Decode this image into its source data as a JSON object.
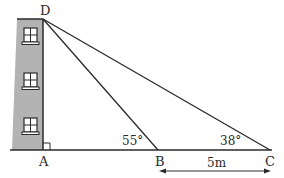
{
  "diagram": {
    "type": "trigonometry-angle-of-elevation",
    "points": {
      "D": {
        "label": "D"
      },
      "A": {
        "label": "A"
      },
      "B": {
        "label": "B"
      },
      "C": {
        "label": "C"
      }
    },
    "angles": {
      "B": "55°",
      "C": "38°"
    },
    "measurements": {
      "BC": "5m"
    },
    "right_angle_at": "A",
    "building": {
      "windows": 3
    },
    "colors": {
      "building_fill": "#b3b3b3",
      "line": "#2a2a2a",
      "window_fill": "#ffffff"
    }
  }
}
